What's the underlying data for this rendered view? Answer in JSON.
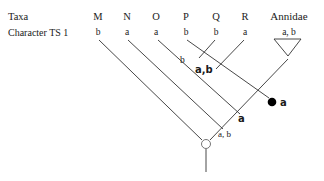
{
  "header": {
    "row_taxa_label": "Taxa",
    "row_character_label": "Character TS 1"
  },
  "taxa": [
    {
      "name": "M",
      "state": "b"
    },
    {
      "name": "N",
      "state": "a"
    },
    {
      "name": "O",
      "state": "a"
    },
    {
      "name": "P",
      "state": "b"
    },
    {
      "name": "Q",
      "state": "b"
    },
    {
      "name": "R",
      "state": "a"
    },
    {
      "name": "Annidae",
      "state": "a, b"
    }
  ],
  "node_labels": {
    "pq_branch_state": "b",
    "pqr_branch_state": "a,b",
    "filled_node_state": "a",
    "below_filled_node_state": "a",
    "root_branch_state": "a, b"
  },
  "colors": {
    "line": "#333333",
    "filled_node": "#000000",
    "open_node_stroke": "#555555"
  }
}
